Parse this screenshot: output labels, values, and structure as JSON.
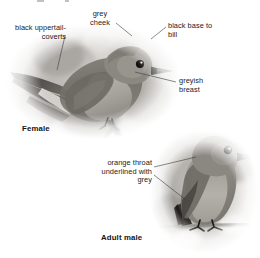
{
  "plate": {
    "background_color": "#ffffff",
    "text_color": "#1b1b1b",
    "leader_color": "#3a3a3a",
    "width": 260,
    "height": 258
  },
  "annotations": {
    "uppertail_coverts": "black uppertail-\ncoverts",
    "grey_cheek": "grey\ncheek",
    "black_base_to_bill": "black base to\nbill",
    "greyish_breast": "greyish\nbreast",
    "orange_throat": "orange throat\nunderlined with\ngrey"
  },
  "labels": {
    "female": "Female",
    "adult_male": "Adult male"
  },
  "figures": [
    {
      "name": "female-bird-photo",
      "subject": "female flycatcher perched on branch, facing right",
      "treatment": "grayscale soft-edged vignette"
    },
    {
      "name": "adult-male-bird-photo",
      "subject": "adult male flycatcher perched upright on twig, facing right",
      "treatment": "grayscale soft-edged vignette"
    }
  ]
}
